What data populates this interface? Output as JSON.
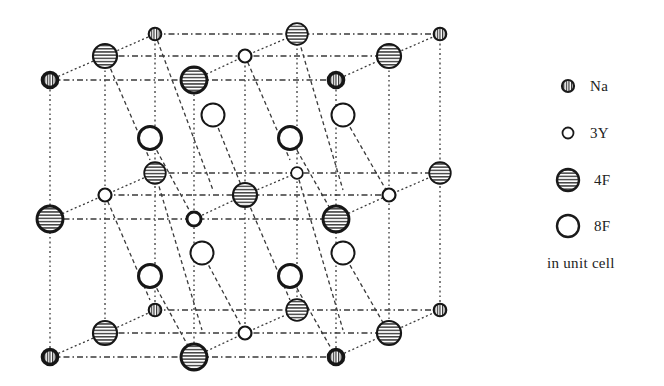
{
  "figure": {
    "type": "crystal-structure",
    "lattice_points": {
      "layers": {
        "back": {
          "xs": [
            155,
            297,
            440
          ],
          "ys": [
            34,
            173,
            310
          ]
        },
        "middle": {
          "xs": [
            105,
            245,
            389
          ],
          "ys": [
            56,
            195,
            333
          ]
        },
        "front": {
          "xs": [
            50,
            194,
            336
          ],
          "ys": [
            80,
            219,
            357
          ]
        }
      }
    },
    "atoms": [
      {
        "layer": "back",
        "col": 0,
        "row": 0,
        "kind": "Na"
      },
      {
        "layer": "back",
        "col": 1,
        "row": 0,
        "kind": "4F"
      },
      {
        "layer": "back",
        "col": 2,
        "row": 0,
        "kind": "Na"
      },
      {
        "layer": "back",
        "col": 0,
        "row": 1,
        "kind": "4F"
      },
      {
        "layer": "back",
        "col": 1,
        "row": 1,
        "kind": "3Y"
      },
      {
        "layer": "back",
        "col": 2,
        "row": 1,
        "kind": "4F"
      },
      {
        "layer": "back",
        "col": 0,
        "row": 2,
        "kind": "Na"
      },
      {
        "layer": "back",
        "col": 1,
        "row": 2,
        "kind": "4F"
      },
      {
        "layer": "back",
        "col": 2,
        "row": 2,
        "kind": "Na"
      },
      {
        "layer": "middle",
        "col": 0,
        "row": 0,
        "kind": "4F"
      },
      {
        "layer": "middle",
        "col": 1,
        "row": 0,
        "kind": "3Y"
      },
      {
        "layer": "middle",
        "col": 2,
        "row": 0,
        "kind": "4F"
      },
      {
        "layer": "middle",
        "col": 0,
        "row": 1,
        "kind": "3Y"
      },
      {
        "layer": "middle",
        "col": 1,
        "row": 1,
        "kind": "4F"
      },
      {
        "layer": "middle",
        "col": 2,
        "row": 1,
        "kind": "3Y"
      },
      {
        "layer": "middle",
        "col": 0,
        "row": 2,
        "kind": "4F"
      },
      {
        "layer": "middle",
        "col": 1,
        "row": 2,
        "kind": "3Y"
      },
      {
        "layer": "middle",
        "col": 2,
        "row": 2,
        "kind": "4F"
      },
      {
        "layer": "front",
        "col": 0,
        "row": 0,
        "kind": "Na"
      },
      {
        "layer": "front",
        "col": 1,
        "row": 0,
        "kind": "4F"
      },
      {
        "layer": "front",
        "col": 2,
        "row": 0,
        "kind": "Na"
      },
      {
        "layer": "front",
        "col": 0,
        "row": 1,
        "kind": "4F"
      },
      {
        "layer": "front",
        "col": 1,
        "row": 1,
        "kind": "3Y"
      },
      {
        "layer": "front",
        "col": 2,
        "row": 1,
        "kind": "4F"
      },
      {
        "layer": "front",
        "col": 0,
        "row": 2,
        "kind": "Na"
      },
      {
        "layer": "front",
        "col": 1,
        "row": 2,
        "kind": "4F"
      },
      {
        "layer": "front",
        "col": 2,
        "row": 2,
        "kind": "Na"
      }
    ],
    "interstitial_8F": [
      {
        "x": 213,
        "y": 115,
        "bold": false
      },
      {
        "x": 343,
        "y": 115,
        "bold": false
      },
      {
        "x": 150,
        "y": 138,
        "bold": true
      },
      {
        "x": 290,
        "y": 138,
        "bold": true
      },
      {
        "x": 202,
        "y": 253,
        "bold": false
      },
      {
        "x": 343,
        "y": 253,
        "bold": false
      },
      {
        "x": 150,
        "y": 276,
        "bold": true
      },
      {
        "x": 290,
        "y": 276,
        "bold": true
      }
    ]
  },
  "legend": {
    "items": [
      {
        "symbol": "Na-icon",
        "label": "Na",
        "y": 86
      },
      {
        "symbol": "3Y-icon",
        "label": "3Y",
        "y": 133
      },
      {
        "symbol": "4F-icon",
        "label": "4F",
        "y": 178
      },
      {
        "symbol": "8F-icon",
        "label": "8F",
        "y": 224
      }
    ],
    "caption": "in unit cell"
  },
  "colors": {
    "ink": "#1a1a1a",
    "line": "#444444",
    "background": "#ffffff"
  }
}
